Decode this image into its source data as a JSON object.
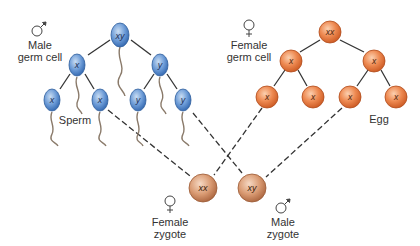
{
  "colors": {
    "sperm_fill_light": "#a9c8ea",
    "sperm_fill_dark": "#3a6fb8",
    "sperm_stroke": "#2d5d9c",
    "egg_fill_light": "#f6b48a",
    "egg_fill_dark": "#d9602a",
    "egg_stroke": "#b04b1c",
    "zygote_fill_light": "#f0c4a8",
    "zygote_fill_dark": "#b8724a",
    "tail": "#8a7a6a",
    "line": "#333333"
  },
  "labels": {
    "male_germ_cell": [
      "Male",
      "germ cell"
    ],
    "female_germ_cell": [
      "Female",
      "germ cell"
    ],
    "sperm": "Sperm",
    "egg": "Egg",
    "female_zygote": [
      "Female",
      "zygote"
    ],
    "male_zygote": [
      "Male",
      "zygote"
    ]
  },
  "symbols": {
    "male": "male-symbol",
    "female": "female-symbol"
  },
  "sperm_lineage": {
    "parent": "xy",
    "level2": [
      "x",
      "y"
    ],
    "level3": [
      "x",
      "x",
      "y",
      "y"
    ]
  },
  "egg_lineage": {
    "parent": "xx",
    "level2": [
      "x",
      "x"
    ],
    "level3": [
      "x",
      "x",
      "x",
      "x"
    ]
  },
  "zygotes": [
    {
      "genotype": "xx",
      "sex": "Female"
    },
    {
      "genotype": "xy",
      "sex": "Male"
    }
  ],
  "fertilization": [
    {
      "from": "sperm x (2nd)",
      "to": "xx zygote"
    },
    {
      "from": "sperm y (4th)",
      "to": "xy zygote"
    },
    {
      "from": "egg x (1st)",
      "to": "xx zygote"
    },
    {
      "from": "egg x (3rd)",
      "to": "xy zygote"
    }
  ]
}
